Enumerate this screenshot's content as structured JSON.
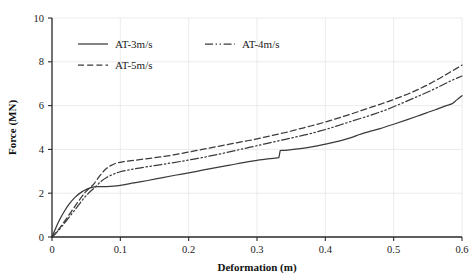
{
  "chart_data": {
    "type": "line",
    "title": "",
    "xlabel": "Deformation (m)",
    "ylabel": "Force (MN)",
    "xlim": [
      0,
      0.6
    ],
    "ylim": [
      0,
      10
    ],
    "xticks": [
      "0",
      "0.1",
      "0.2",
      "0.3",
      "0.4",
      "0.5",
      "0.6"
    ],
    "xtick_values": [
      0,
      0.1,
      0.2,
      0.3,
      0.4,
      0.5,
      0.6
    ],
    "yticks": [
      "0",
      "2",
      "4",
      "6",
      "8",
      "10"
    ],
    "ytick_values": [
      0,
      2,
      4,
      6,
      8,
      10
    ],
    "grid": true,
    "legend_position": "upper-left",
    "series": [
      {
        "name": "AT-3m/s",
        "style": "solid",
        "color": "#3a3a3a",
        "x": [
          0,
          0.004,
          0.01,
          0.017,
          0.025,
          0.034,
          0.043,
          0.052,
          0.06,
          0.066,
          0.072,
          0.08,
          0.09,
          0.1,
          0.12,
          0.14,
          0.16,
          0.18,
          0.2,
          0.22,
          0.24,
          0.26,
          0.28,
          0.3,
          0.32,
          0.332,
          0.334,
          0.345,
          0.36,
          0.38,
          0.4,
          0.42,
          0.44,
          0.45,
          0.465,
          0.48,
          0.5,
          0.52,
          0.54,
          0.56,
          0.575,
          0.585,
          0.592,
          0.6
        ],
        "y": [
          0,
          0.3,
          0.72,
          1.12,
          1.5,
          1.82,
          2.05,
          2.2,
          2.28,
          2.3,
          2.3,
          2.3,
          2.32,
          2.36,
          2.47,
          2.58,
          2.7,
          2.82,
          2.93,
          3.05,
          3.17,
          3.28,
          3.4,
          3.5,
          3.58,
          3.62,
          3.95,
          3.97,
          4.02,
          4.12,
          4.24,
          4.38,
          4.56,
          4.68,
          4.82,
          4.95,
          5.15,
          5.36,
          5.58,
          5.8,
          5.98,
          6.08,
          6.25,
          6.45
        ]
      },
      {
        "name": "AT-4m/s",
        "style": "dash-dot-dot",
        "color": "#3a3a3a",
        "x": [
          0,
          0.008,
          0.018,
          0.028,
          0.038,
          0.048,
          0.056,
          0.064,
          0.072,
          0.08,
          0.09,
          0.1,
          0.115,
          0.13,
          0.15,
          0.17,
          0.19,
          0.21,
          0.23,
          0.25,
          0.27,
          0.29,
          0.31,
          0.33,
          0.35,
          0.37,
          0.39,
          0.41,
          0.43,
          0.45,
          0.47,
          0.49,
          0.51,
          0.53,
          0.55,
          0.57,
          0.585,
          0.6
        ],
        "y": [
          0,
          0.25,
          0.62,
          1.02,
          1.42,
          1.82,
          2.08,
          2.3,
          2.55,
          2.72,
          2.87,
          2.98,
          3.08,
          3.16,
          3.26,
          3.36,
          3.46,
          3.57,
          3.69,
          3.82,
          3.96,
          4.1,
          4.24,
          4.38,
          4.52,
          4.66,
          4.82,
          5.0,
          5.2,
          5.4,
          5.6,
          5.82,
          6.08,
          6.35,
          6.62,
          6.92,
          7.15,
          7.35
        ]
      },
      {
        "name": "AT-5m/s",
        "style": "dashed",
        "color": "#3a3a3a",
        "x": [
          0,
          0.008,
          0.018,
          0.028,
          0.038,
          0.048,
          0.056,
          0.062,
          0.07,
          0.078,
          0.086,
          0.095,
          0.105,
          0.12,
          0.14,
          0.16,
          0.18,
          0.2,
          0.22,
          0.24,
          0.26,
          0.28,
          0.3,
          0.32,
          0.34,
          0.36,
          0.38,
          0.4,
          0.42,
          0.44,
          0.46,
          0.48,
          0.5,
          0.52,
          0.54,
          0.56,
          0.58,
          0.6
        ],
        "y": [
          0,
          0.28,
          0.7,
          1.15,
          1.6,
          2.02,
          2.26,
          2.45,
          2.8,
          3.08,
          3.26,
          3.38,
          3.44,
          3.5,
          3.58,
          3.66,
          3.76,
          3.88,
          4.0,
          4.12,
          4.24,
          4.36,
          4.48,
          4.62,
          4.76,
          4.92,
          5.08,
          5.25,
          5.44,
          5.64,
          5.85,
          6.06,
          6.28,
          6.52,
          6.8,
          7.12,
          7.48,
          7.85
        ]
      }
    ],
    "legend": [
      {
        "label": "AT-3m/s",
        "style": "solid"
      },
      {
        "label": "AT-4m/s",
        "style": "dash-dot-dot"
      },
      {
        "label": "AT-5m/s",
        "style": "dashed"
      }
    ]
  }
}
